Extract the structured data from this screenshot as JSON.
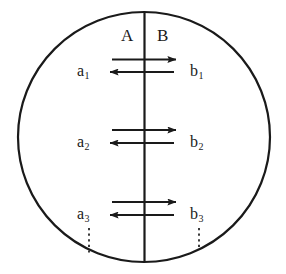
{
  "figure": {
    "type": "diagram",
    "background_color": "#ffffff",
    "stroke_color": "#1a1a1a"
  },
  "boundary": {
    "shape": "circle",
    "center_x": 144,
    "center_y": 137,
    "radius_x": 126,
    "radius_y": 125,
    "stroke_width": 2.2
  },
  "divider": {
    "name": "vertical-divider",
    "x": 144.5,
    "y_top": 13,
    "y_bottom": 261,
    "stroke_width": 2.2
  },
  "compartments": [
    {
      "id": "A",
      "label": "A",
      "side": "left",
      "label_x": 121,
      "label_y": 27
    },
    {
      "id": "B",
      "label": "B",
      "side": "right",
      "label_x": 157,
      "label_y": 27
    }
  ],
  "exchange_rows": [
    {
      "index": 1,
      "left_label": "a",
      "left_sub": "1",
      "right_label": "b",
      "right_sub": "1",
      "left_label_x": 77,
      "right_label_x": 190,
      "label_y": 63,
      "arrow_right": {
        "x_start": 112,
        "x_end": 176,
        "y": 59.5
      },
      "arrow_left": {
        "x_start": 174,
        "x_end": 110,
        "y": 72
      }
    },
    {
      "index": 2,
      "left_label": "a",
      "left_sub": "2",
      "right_label": "b",
      "right_sub": "2",
      "left_label_x": 77,
      "right_label_x": 190,
      "label_y": 134,
      "arrow_right": {
        "x_start": 112,
        "x_end": 176,
        "y": 130
      },
      "arrow_left": {
        "x_start": 174,
        "x_end": 110,
        "y": 143
      }
    },
    {
      "index": 3,
      "left_label": "a",
      "left_sub": "3",
      "right_label": "b",
      "right_sub": "3",
      "left_label_x": 77,
      "right_label_x": 190,
      "label_y": 206,
      "arrow_right": {
        "x_start": 112,
        "x_end": 176,
        "y": 202
      },
      "arrow_left": {
        "x_start": 174,
        "x_end": 110,
        "y": 215
      }
    }
  ],
  "continuation_marks": [
    {
      "id": "left-ellipsis",
      "x": 89,
      "y_top": 228,
      "y_bottom": 253
    },
    {
      "id": "right-ellipsis",
      "x": 199,
      "y_top": 228,
      "y_bottom": 250
    }
  ]
}
